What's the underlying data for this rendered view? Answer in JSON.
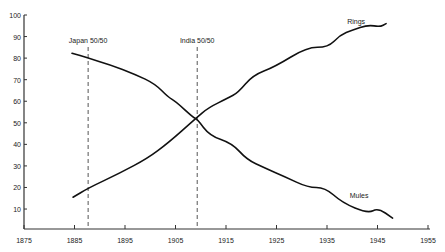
{
  "chart_data": {
    "type": "line",
    "title": "",
    "xlabel": "",
    "ylabel": "",
    "xlim": [
      1875,
      1955
    ],
    "ylim": [
      0,
      100
    ],
    "grid": false,
    "x_ticks": [
      1875,
      1885,
      1895,
      1905,
      1915,
      1925,
      1935,
      1945,
      1955
    ],
    "y_ticks": [
      10,
      20,
      30,
      40,
      50,
      60,
      70,
      80,
      90,
      100
    ],
    "series": [
      {
        "name": "Rings",
        "label_pos": {
          "x": 1939,
          "y": 96
        },
        "points": [
          [
            1884.7,
            15.5
          ],
          [
            1887.7,
            19.7
          ],
          [
            1894,
            26.7
          ],
          [
            1899.5,
            33.6
          ],
          [
            1903.5,
            40.6
          ],
          [
            1909,
            52
          ],
          [
            1911.5,
            57
          ],
          [
            1915.4,
            61.5
          ],
          [
            1917.4,
            64
          ],
          [
            1920.3,
            72
          ],
          [
            1924.7,
            76
          ],
          [
            1931,
            85
          ],
          [
            1935.2,
            85
          ],
          [
            1937.6,
            90.7
          ],
          [
            1940,
            93
          ],
          [
            1943.1,
            95.4
          ],
          [
            1945.5,
            94.5
          ],
          [
            1946.7,
            96
          ]
        ]
      },
      {
        "name": "Mules",
        "label_pos": {
          "x": 1939.5,
          "y": 15
        },
        "points": [
          [
            1884.5,
            82.3
          ],
          [
            1887.7,
            80
          ],
          [
            1892,
            77
          ],
          [
            1897,
            72.5
          ],
          [
            1901,
            68
          ],
          [
            1903.5,
            62
          ],
          [
            1905,
            60
          ],
          [
            1908.5,
            52.5
          ],
          [
            1909.3,
            51.7
          ],
          [
            1911.8,
            44
          ],
          [
            1916.2,
            40.5
          ],
          [
            1919.1,
            33
          ],
          [
            1922.7,
            29
          ],
          [
            1926.7,
            25
          ],
          [
            1931.2,
            20
          ],
          [
            1934.6,
            20
          ],
          [
            1938,
            13
          ],
          [
            1943.1,
            8
          ],
          [
            1945.1,
            10.5
          ],
          [
            1948,
            5.8
          ]
        ]
      }
    ],
    "annotations": [
      {
        "label": "Japan 50/50",
        "x": 1887.7,
        "style": "dashed-vertical"
      },
      {
        "label": "India 50/50",
        "x": 1909.3,
        "style": "dashed-vertical"
      }
    ]
  }
}
